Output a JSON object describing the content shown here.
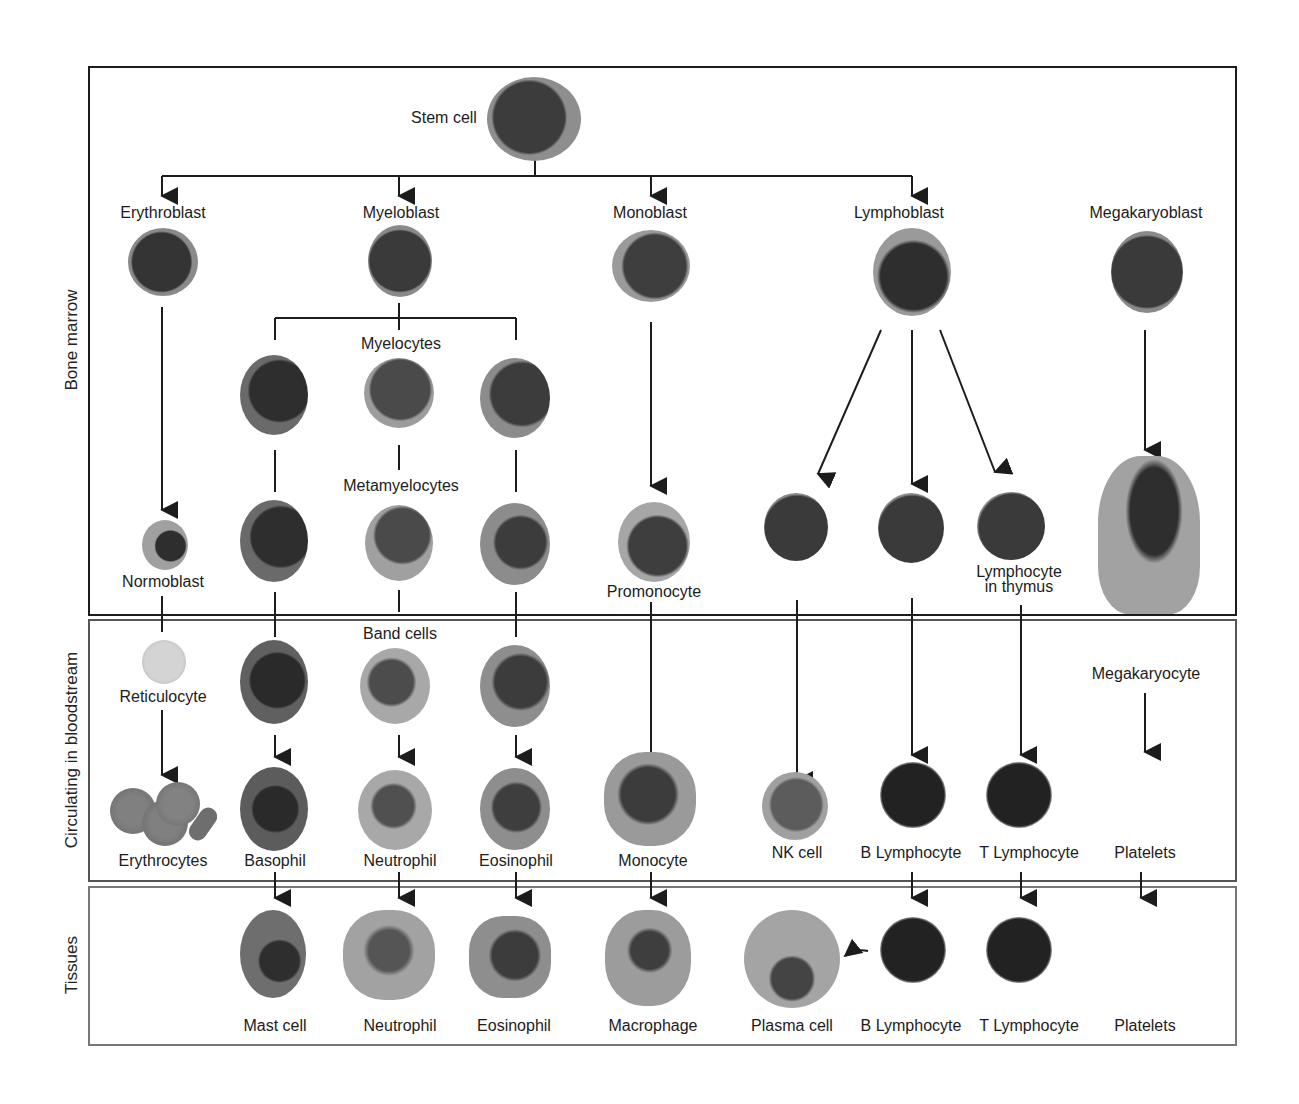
{
  "diagram": {
    "colors": {
      "line": "#1c1c1c",
      "cytoplasm": "#9a9a9a",
      "nucleus": "#3a3a3a",
      "background": "#ffffff"
    },
    "compartments": [
      {
        "id": "bone_marrow",
        "label": "Bone marrow"
      },
      {
        "id": "bloodstream",
        "label": "Circulating in bloodstream"
      },
      {
        "id": "tissues",
        "label": "Tissues"
      }
    ],
    "bone_marrow": {
      "stem_cell": "Stem cell",
      "blasts": [
        "Erythroblast",
        "Myeloblast",
        "Monoblast",
        "Lymphoblast",
        "Megakaryoblast"
      ],
      "myelocytes": "Myelocytes",
      "metamyelocytes": "Metamyelocytes",
      "normoblast": "Normoblast",
      "promonocyte": "Promonocyte",
      "lymphocyte_in_thymus": "Lymphocyte in thymus"
    },
    "bloodstream": {
      "band_cells": "Band cells",
      "reticulocyte": "Reticulocyte",
      "megakaryocyte": "Megakaryocyte",
      "mature": [
        "Erythrocytes",
        "Basophil",
        "Neutrophil",
        "Eosinophil",
        "Monocyte",
        "NK cell",
        "B Lymphocyte",
        "T Lymphocyte",
        "Platelets"
      ]
    },
    "tissues": {
      "mature": [
        "Mast cell",
        "Neutrophil",
        "Eosinophil",
        "Macrophage",
        "Plasma cell",
        "B Lymphocyte",
        "T Lymphocyte",
        "Platelets"
      ]
    },
    "lineages": [
      {
        "from": "Stem cell",
        "to": [
          "Erythroblast",
          "Myeloblast",
          "Monoblast",
          "Lymphoblast"
        ]
      },
      {
        "path": [
          "Erythroblast",
          "Normoblast",
          "Reticulocyte",
          "Erythrocytes"
        ]
      },
      {
        "path": [
          "Myeloblast",
          "Myelocytes",
          "Metamyelocytes",
          "Band cells",
          "Basophil / Neutrophil / Eosinophil"
        ]
      },
      {
        "path": [
          "Basophil",
          "Mast cell"
        ]
      },
      {
        "path": [
          "Neutrophil",
          "Neutrophil"
        ]
      },
      {
        "path": [
          "Eosinophil",
          "Eosinophil"
        ]
      },
      {
        "path": [
          "Monoblast",
          "Promonocyte",
          "Monocyte",
          "Macrophage"
        ]
      },
      {
        "from": "Lymphoblast",
        "to": [
          "NK cell",
          "B Lymphocyte",
          "Lymphocyte in thymus"
        ]
      },
      {
        "path": [
          "Lymphocyte in thymus",
          "T Lymphocyte",
          "T Lymphocyte"
        ]
      },
      {
        "path": [
          "B Lymphocyte",
          "B Lymphocyte",
          "Plasma cell"
        ]
      },
      {
        "path": [
          "Megakaryoblast",
          "Megakaryocyte",
          "Platelets",
          "Platelets"
        ]
      }
    ]
  }
}
